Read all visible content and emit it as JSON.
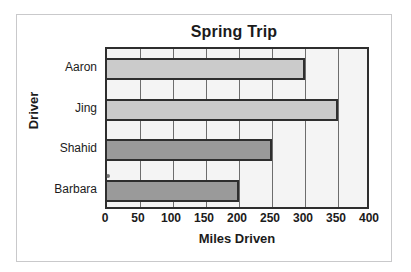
{
  "chart_data": {
    "type": "bar",
    "orientation": "horizontal",
    "title": "Spring Trip",
    "xlabel": "Miles Driven",
    "ylabel": "Driver",
    "categories": [
      "Aaron",
      "Jing",
      "Shahid",
      "Barbara"
    ],
    "values": [
      300,
      350,
      250,
      200
    ],
    "series": [
      {
        "name": "Miles Driven",
        "values": [
          300,
          350,
          250,
          200
        ]
      }
    ],
    "bar_colors": [
      "#cbcbcb",
      "#cbcbcb",
      "#9a9a9a",
      "#9a9a9a"
    ],
    "xlim": [
      0,
      400
    ],
    "xticks": [
      0,
      50,
      100,
      150,
      200,
      250,
      300,
      350,
      400
    ],
    "xtick_labels": [
      "0",
      "50",
      "100",
      "150",
      "200",
      "250",
      "300",
      "350",
      "400"
    ],
    "grid": true,
    "grid_axis": "x",
    "legend": false,
    "colors": {
      "plot_background": "#f4f4f4",
      "frame": "#2e2e2e",
      "gridline": "#6d6d6d",
      "bar_light": "#cbcbcb",
      "bar_dark": "#9a9a9a",
      "bar_outline": "#2e2e2e",
      "text": "#1b1b1b",
      "figure_border": "#c9c9cb",
      "figure_background": "#ffffff"
    }
  }
}
